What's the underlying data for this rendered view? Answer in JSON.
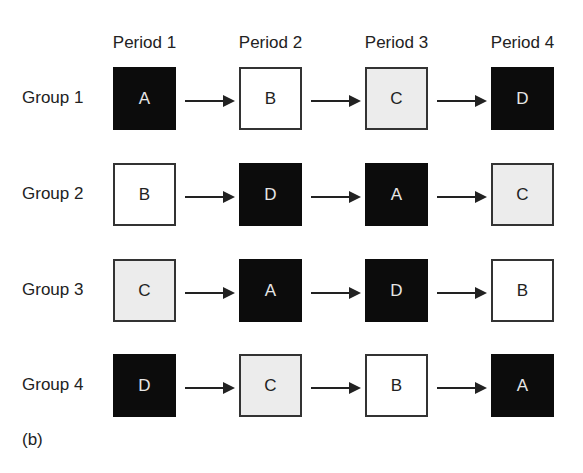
{
  "periods": [
    "Period 1",
    "Period 2",
    "Period 3",
    "Period 4"
  ],
  "groups": [
    {
      "label": "Group 1",
      "cells": [
        {
          "t": "A",
          "s": "dark"
        },
        {
          "t": "B",
          "s": "white"
        },
        {
          "t": "C",
          "s": "light"
        },
        {
          "t": "D",
          "s": "dark"
        }
      ]
    },
    {
      "label": "Group 2",
      "cells": [
        {
          "t": "B",
          "s": "white"
        },
        {
          "t": "D",
          "s": "dark"
        },
        {
          "t": "A",
          "s": "dark"
        },
        {
          "t": "C",
          "s": "light"
        }
      ]
    },
    {
      "label": "Group 3",
      "cells": [
        {
          "t": "C",
          "s": "light"
        },
        {
          "t": "A",
          "s": "dark"
        },
        {
          "t": "D",
          "s": "dark"
        },
        {
          "t": "B",
          "s": "white"
        }
      ]
    },
    {
      "label": "Group 4",
      "cells": [
        {
          "t": "D",
          "s": "dark"
        },
        {
          "t": "C",
          "s": "light"
        },
        {
          "t": "B",
          "s": "white"
        },
        {
          "t": "A",
          "s": "dark"
        }
      ]
    }
  ],
  "panel_label": "(b)",
  "colors": {
    "dark": "#0c0c0c",
    "white": "#ffffff",
    "light": "#ececec"
  }
}
